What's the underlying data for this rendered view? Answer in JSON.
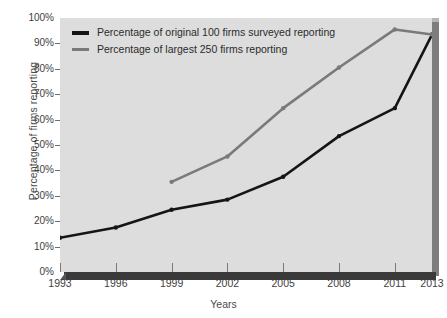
{
  "chart_data": {
    "type": "line",
    "title": "",
    "xlabel": "Years",
    "ylabel": "Percentage of firms reporting",
    "categories": [
      "1993",
      "1996",
      "1999",
      "2002",
      "2005",
      "2008",
      "2011",
      "2013"
    ],
    "x": [
      1993,
      1996,
      1999,
      2002,
      2005,
      2008,
      2011,
      2013
    ],
    "xlim": [
      1993,
      2013
    ],
    "ylim": [
      0,
      100
    ],
    "ytick_labels": [
      "0%",
      "10%",
      "20%",
      "30%",
      "40%",
      "50%",
      "60%",
      "70%",
      "80%",
      "90%",
      "100%"
    ],
    "ytick_values": [
      0,
      10,
      20,
      30,
      40,
      50,
      60,
      70,
      80,
      90,
      100
    ],
    "grid": false,
    "legend_position": "top-left",
    "series": [
      {
        "name": "Percentage of original 100 firms surveyed reporting",
        "color": "#151515",
        "x": [
          1993,
          1996,
          1999,
          2002,
          2005,
          2008,
          2011,
          2013
        ],
        "values": [
          13.5,
          17.5,
          24.5,
          28.5,
          37.5,
          53.5,
          64.5,
          93.5
        ]
      },
      {
        "name": "Percentage of largest 250 firms reporting",
        "color": "#7a7a7a",
        "x": [
          1999,
          2002,
          2005,
          2008,
          2011,
          2013
        ],
        "values": [
          35.5,
          45.5,
          64.5,
          80.5,
          95.5,
          93.5
        ]
      }
    ]
  },
  "legend": {
    "items": [
      {
        "label": "Percentage of original 100 firms surveyed reporting",
        "color": "#151515"
      },
      {
        "label": "Percentage of largest 250 firms reporting",
        "color": "#7a7a7a"
      }
    ]
  },
  "colors": {
    "plot_background": "#dddddd",
    "page_background": "#ffffff",
    "axis_text": "#3e3e3e",
    "series_1": "#151515",
    "series_2": "#7a7a7a",
    "slab_bottom": "#3a3a3a",
    "slab_right": "#7d7d7d"
  }
}
